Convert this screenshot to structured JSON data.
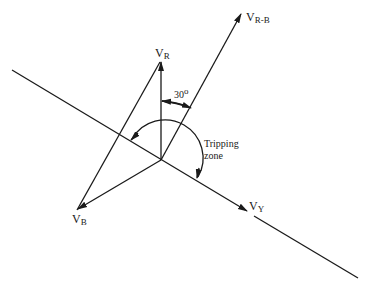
{
  "diagram": {
    "type": "phasor-diagram",
    "phasors": [
      {
        "id": "vr",
        "main": "V",
        "sub": "R"
      },
      {
        "id": "vrb",
        "main": "V",
        "sub": "R-B"
      },
      {
        "id": "vy",
        "main": "V",
        "sub": "Y"
      },
      {
        "id": "vb",
        "main": "V",
        "sub": "B"
      }
    ],
    "angle_label": "30",
    "angle_degree_mark": "o",
    "zone_label_line1": "Tripping",
    "zone_label_line2": "zone",
    "line_color": "#1a1a1a",
    "background": "#ffffff"
  }
}
